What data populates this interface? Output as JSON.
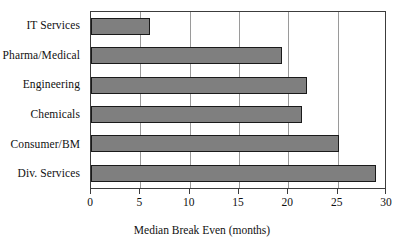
{
  "chart_data": {
    "type": "bar",
    "orientation": "horizontal",
    "title": "",
    "xlabel": "Median Break Even (months)",
    "ylabel": "",
    "categories": [
      "IT Services",
      "Pharma/Medical",
      "Engineering",
      "Chemicals",
      "Consumer/BM",
      "Div. Services"
    ],
    "values": [
      6,
      19.4,
      21.9,
      21.4,
      25.1,
      28.9
    ],
    "xlim": [
      0,
      30
    ],
    "xticks": [
      0,
      5,
      10,
      15,
      20,
      25,
      30
    ],
    "xtick_labels": [
      "0",
      "5",
      "10",
      "15",
      "20",
      "25",
      "30"
    ],
    "grid": "vertical",
    "legend": "none",
    "bar_fill_color": "#7f7f7f",
    "bar_border_color": "#1a1a1a",
    "plot_border_color": "#3c3c3c",
    "gridline_color": "#9a9a9a",
    "background_color": "#ffffff",
    "series": [
      {
        "name": "Median Break Even",
        "values": [
          6,
          19.4,
          21.9,
          21.4,
          25.1,
          28.9
        ]
      }
    ]
  }
}
